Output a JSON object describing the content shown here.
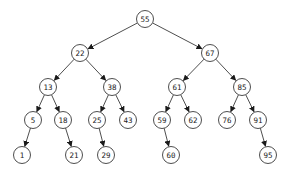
{
  "diagram": {
    "type": "binary-search-tree",
    "colors": {
      "stroke": "#3a3a3a",
      "text": "#222222",
      "background": "#ffffff"
    },
    "node_radius": 8.5,
    "nodes": [
      {
        "id": "n55",
        "label": "55",
        "x": 145,
        "y": 19
      },
      {
        "id": "n22",
        "label": "22",
        "x": 80,
        "y": 53
      },
      {
        "id": "n67",
        "label": "67",
        "x": 210,
        "y": 53
      },
      {
        "id": "n13",
        "label": "13",
        "x": 48,
        "y": 87
      },
      {
        "id": "n38",
        "label": "38",
        "x": 112,
        "y": 87
      },
      {
        "id": "n61",
        "label": "61",
        "x": 177,
        "y": 87
      },
      {
        "id": "n85",
        "label": "85",
        "x": 242,
        "y": 87
      },
      {
        "id": "n5",
        "label": "5",
        "x": 33,
        "y": 120
      },
      {
        "id": "n18",
        "label": "18",
        "x": 63,
        "y": 120
      },
      {
        "id": "n25",
        "label": "25",
        "x": 97,
        "y": 120
      },
      {
        "id": "n43",
        "label": "43",
        "x": 128,
        "y": 120
      },
      {
        "id": "n59",
        "label": "59",
        "x": 162,
        "y": 120
      },
      {
        "id": "n62",
        "label": "62",
        "x": 193,
        "y": 120
      },
      {
        "id": "n76",
        "label": "76",
        "x": 227,
        "y": 120
      },
      {
        "id": "n91",
        "label": "91",
        "x": 258,
        "y": 120
      },
      {
        "id": "n1",
        "label": "1",
        "x": 22,
        "y": 155
      },
      {
        "id": "n21",
        "label": "21",
        "x": 74,
        "y": 155
      },
      {
        "id": "n29",
        "label": "29",
        "x": 106,
        "y": 155
      },
      {
        "id": "n60",
        "label": "60",
        "x": 171,
        "y": 155
      },
      {
        "id": "n95",
        "label": "95",
        "x": 268,
        "y": 155
      }
    ],
    "edges": [
      {
        "from": "n55",
        "to": "n22"
      },
      {
        "from": "n55",
        "to": "n67"
      },
      {
        "from": "n22",
        "to": "n13"
      },
      {
        "from": "n22",
        "to": "n38"
      },
      {
        "from": "n67",
        "to": "n61"
      },
      {
        "from": "n67",
        "to": "n85"
      },
      {
        "from": "n13",
        "to": "n5"
      },
      {
        "from": "n13",
        "to": "n18"
      },
      {
        "from": "n38",
        "to": "n25"
      },
      {
        "from": "n38",
        "to": "n43"
      },
      {
        "from": "n61",
        "to": "n59"
      },
      {
        "from": "n61",
        "to": "n62"
      },
      {
        "from": "n85",
        "to": "n76"
      },
      {
        "from": "n85",
        "to": "n91"
      },
      {
        "from": "n5",
        "to": "n1"
      },
      {
        "from": "n18",
        "to": "n21"
      },
      {
        "from": "n25",
        "to": "n29"
      },
      {
        "from": "n59",
        "to": "n60"
      },
      {
        "from": "n91",
        "to": "n95"
      }
    ]
  }
}
